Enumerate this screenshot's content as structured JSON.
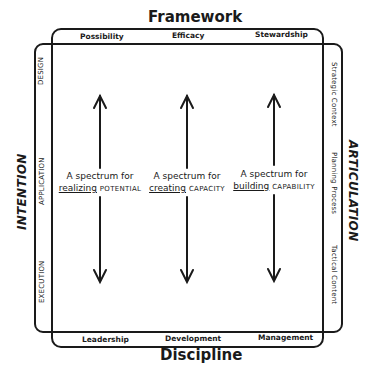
{
  "frame": {
    "top_title": "Framework",
    "bottom_title": "Discipline",
    "left_title": "INTENTION",
    "right_title": "ARTICULATION"
  },
  "top_labels": [
    "Possibility",
    "Efficacy",
    "Stewardship"
  ],
  "bottom_labels": [
    "Leadership",
    "Development",
    "Management"
  ],
  "left_labels": [
    "DESIGN",
    "APPLICATION",
    "EXECUTION"
  ],
  "right_labels": [
    "Strategic Context",
    "Planning Process",
    "Tactical Content"
  ],
  "spectrums": [
    {
      "prefix": "A spectrum for",
      "verb": "realizing",
      "noun": "POTENTIAL"
    },
    {
      "prefix": "A spectrum for",
      "verb": "creating",
      "noun": "CAPACITY"
    },
    {
      "prefix": "A spectrum for",
      "verb": "building",
      "noun": "CAPABILITY"
    }
  ],
  "colors": {
    "ink": "#1a1a1a",
    "background": "#ffffff"
  }
}
